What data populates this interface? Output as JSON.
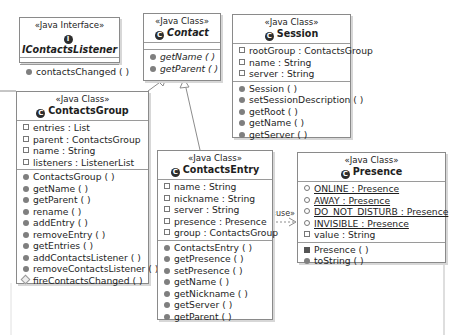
{
  "diagram": {
    "type": "UML class diagram",
    "classes": [
      {
        "id": "icontactslistener",
        "stereotype": "«Java Interface»",
        "name": "IContactsListener",
        "icon": "interface-icon",
        "icon_glyph": "I",
        "abstract": true,
        "fields": [],
        "methods": [
          {
            "label": "contactsChanged ( )",
            "visibility": "public",
            "italic": false
          }
        ]
      },
      {
        "id": "contact",
        "stereotype": "«Java Class»",
        "name": "Contact",
        "icon": "class-icon",
        "icon_glyph": "C",
        "abstract": true,
        "fields": [],
        "methods": [
          {
            "label": "getName ( )",
            "visibility": "public",
            "italic": true
          },
          {
            "label": "getParent ( )",
            "visibility": "public",
            "italic": true
          }
        ]
      },
      {
        "id": "session",
        "stereotype": "«Java Class»",
        "name": "Session",
        "icon": "class-icon",
        "icon_glyph": "C",
        "abstract": false,
        "fields": [
          {
            "label": "rootGroup : ContactsGroup",
            "visibility": "field"
          },
          {
            "label": "name : String",
            "visibility": "field"
          },
          {
            "label": "server : String",
            "visibility": "field"
          }
        ],
        "methods": [
          {
            "label": "Session ( )",
            "visibility": "public"
          },
          {
            "label": "setSessionDescription ( )",
            "visibility": "public"
          },
          {
            "label": "getRoot ( )",
            "visibility": "public"
          },
          {
            "label": "getName ( )",
            "visibility": "public"
          },
          {
            "label": "getServer ( )",
            "visibility": "public"
          }
        ]
      },
      {
        "id": "contactsgroup",
        "stereotype": "«Java Class»",
        "name": "ContactsGroup",
        "icon": "class-icon",
        "icon_glyph": "C",
        "abstract": false,
        "fields": [
          {
            "label": "entries : List",
            "visibility": "field"
          },
          {
            "label": "parent : ContactsGroup",
            "visibility": "field"
          },
          {
            "label": "name : String",
            "visibility": "field"
          },
          {
            "label": "listeners : ListenerList",
            "visibility": "field"
          }
        ],
        "methods": [
          {
            "label": "ContactsGroup ( )",
            "visibility": "public"
          },
          {
            "label": "getName ( )",
            "visibility": "public"
          },
          {
            "label": "getParent ( )",
            "visibility": "public"
          },
          {
            "label": "rename ( )",
            "visibility": "public"
          },
          {
            "label": "addEntry ( )",
            "visibility": "public"
          },
          {
            "label": "removeEntry ( )",
            "visibility": "public"
          },
          {
            "label": "getEntries ( )",
            "visibility": "public"
          },
          {
            "label": "addContactsListener ( )",
            "visibility": "public"
          },
          {
            "label": "removeContactsListener ( )",
            "visibility": "public"
          },
          {
            "label": "fireContactsChanged ( )",
            "visibility": "protected"
          }
        ]
      },
      {
        "id": "contactsentry",
        "stereotype": "«Java Class»",
        "name": "ContactsEntry",
        "icon": "class-icon",
        "icon_glyph": "C",
        "abstract": false,
        "fields": [
          {
            "label": "name : String",
            "visibility": "field"
          },
          {
            "label": "nickname : String",
            "visibility": "field"
          },
          {
            "label": "server : String",
            "visibility": "field"
          },
          {
            "label": "presence : Presence",
            "visibility": "field"
          },
          {
            "label": "group : ContactsGroup",
            "visibility": "field"
          }
        ],
        "methods": [
          {
            "label": "ContactsEntry ( )",
            "visibility": "public"
          },
          {
            "label": "getPresence ( )",
            "visibility": "public"
          },
          {
            "label": "setPresence ( )",
            "visibility": "public"
          },
          {
            "label": "getName ( )",
            "visibility": "public"
          },
          {
            "label": "getNickname ( )",
            "visibility": "public"
          },
          {
            "label": "getServer ( )",
            "visibility": "public"
          },
          {
            "label": "getParent ( )",
            "visibility": "public"
          }
        ]
      },
      {
        "id": "presence",
        "stereotype": "«Java Class»",
        "name": "Presence",
        "icon": "class-icon",
        "icon_glyph": "C",
        "abstract": false,
        "fields": [
          {
            "label": "ONLINE : Presence",
            "visibility": "static"
          },
          {
            "label": "AWAY : Presence",
            "visibility": "static"
          },
          {
            "label": "DO_NOT_DISTURB : Presence",
            "visibility": "static"
          },
          {
            "label": "INVISIBLE : Presence",
            "visibility": "static"
          },
          {
            "label": "value : String",
            "visibility": "field"
          }
        ],
        "methods": [
          {
            "label": "Presence ( )",
            "visibility": "private"
          },
          {
            "label": "toString ( )",
            "visibility": "public"
          }
        ]
      }
    ],
    "relations": [
      {
        "from": "contactsgroup",
        "to": "contact",
        "kind": "generalization"
      },
      {
        "from": "contactsentry",
        "to": "contact",
        "kind": "generalization"
      },
      {
        "from": "contactsentry",
        "to": "presence",
        "kind": "dependency",
        "label": "«use»"
      }
    ],
    "colors": {
      "border": "#8a8a8a",
      "shadow": "#d7d7d7",
      "icon": "#2d2d2d",
      "line": "#8c8c8c"
    }
  }
}
